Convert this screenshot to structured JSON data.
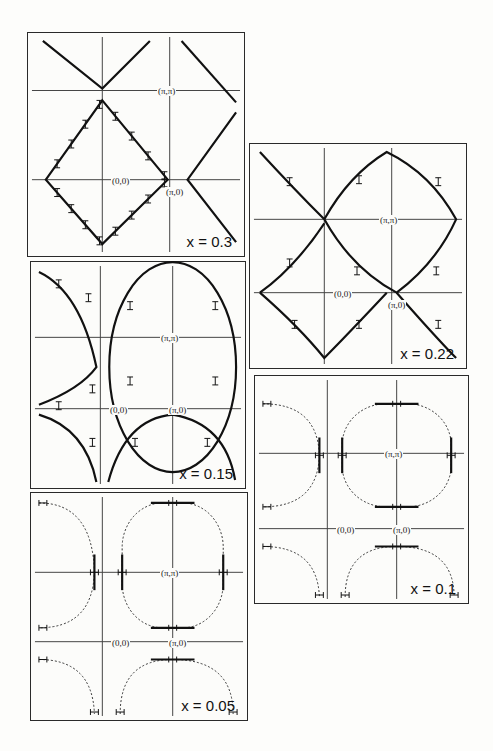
{
  "figure": {
    "panels": [
      {
        "id": "p1",
        "label": "x = 0.3",
        "box": [
          27,
          32,
          218,
          225
        ],
        "axes": {
          "v": [
            75,
            143
          ],
          "h": [
            58,
            148
          ]
        },
        "labels": {
          "origin": "(0,0)",
          "pipi": "(π,π)",
          "pi0": "(π,0)"
        },
        "style": "diamond"
      },
      {
        "id": "p2",
        "label": "x = 0.22",
        "box": [
          249,
          143,
          218,
          226
        ],
        "axes": {
          "v": [
            75,
            143
          ],
          "h": [
            76,
            150
          ]
        },
        "labels": {
          "origin": "(0,0)",
          "pipi": "(π,π)",
          "pi0": "(π,0)"
        },
        "style": "rounded-diamond"
      },
      {
        "id": "p3",
        "label": "x = 0.15",
        "box": [
          30,
          261,
          216,
          228
        ],
        "axes": {
          "v": [
            70,
            143
          ],
          "h": [
            76,
            148
          ]
        },
        "labels": {
          "origin": "(0,0)",
          "pipi": "(π,π)",
          "pi0": "(π,0)"
        },
        "style": "circle"
      },
      {
        "id": "p4",
        "label": "x = 0.1",
        "box": [
          254,
          375,
          215,
          229
        ],
        "axes": {
          "v": [
            73,
            143
          ],
          "h": [
            78,
            154
          ]
        },
        "labels": {
          "origin": "(0,0)",
          "pipi": "(π,π)",
          "pi0": "(π,0)"
        },
        "style": "rounded-square"
      },
      {
        "id": "p5",
        "label": "x = 0.05",
        "box": [
          30,
          492,
          218,
          229
        ],
        "axes": {
          "v": [
            72,
            143
          ],
          "h": [
            80,
            150
          ]
        },
        "labels": {
          "origin": "(0,0)",
          "pipi": "(π,π)",
          "pi0": "(π,0)"
        },
        "style": "square"
      }
    ]
  },
  "chart_data": [
    {
      "type": "scatter",
      "title": "Fermi surface, x = 0.3",
      "doping": 0.3,
      "shape": "diamond (straight lines through (π,0))",
      "xlabel": "kx",
      "ylabel": "ky",
      "points_labeled": [
        "(0,0)",
        "(π,π)",
        "(π,0)"
      ]
    },
    {
      "type": "scatter",
      "title": "Fermi surface, x = 0.22",
      "doping": 0.22,
      "shape": "rounded diamond centered at (π,π) touching (π,0)",
      "points_labeled": [
        "(0,0)",
        "(π,π)",
        "(π,0)"
      ]
    },
    {
      "type": "scatter",
      "title": "Fermi surface, x = 0.15",
      "doping": 0.15,
      "shape": "circular contour around (π,π)",
      "points_labeled": [
        "(0,0)",
        "(π,π)",
        "(π,0)"
      ]
    },
    {
      "type": "scatter",
      "title": "Fermi surface, x = 0.1",
      "doping": 0.1,
      "shape": "rounded square around (π,π), dashed interpolation between data segments",
      "points_labeled": [
        "(0,0)",
        "(π,π)",
        "(π,0)"
      ]
    },
    {
      "type": "scatter",
      "title": "Fermi surface, x = 0.05",
      "doping": 0.05,
      "shape": "square-like contour around (π,π), dashed interpolation",
      "points_labeled": [
        "(0,0)",
        "(π,π)",
        "(π,0)"
      ]
    }
  ]
}
